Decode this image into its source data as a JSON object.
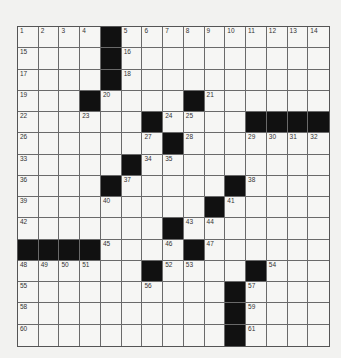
{
  "puzzle": {
    "rows": 15,
    "cols": 15,
    "grid": [
      [
        "1",
        "2",
        "3",
        "4",
        "#",
        "5",
        "6",
        "7",
        "8",
        "9",
        "10",
        "11",
        "12",
        "13",
        "14"
      ],
      [
        "15",
        "",
        "",
        "",
        "#",
        "16",
        "",
        "",
        "",
        "",
        "",
        "",
        "",
        "",
        ""
      ],
      [
        "17",
        "",
        "",
        "",
        "#",
        "18",
        "",
        "",
        "",
        "",
        "",
        "",
        "",
        "",
        ""
      ],
      [
        "19",
        "",
        "",
        "#",
        "20",
        "",
        "",
        "",
        "#",
        "21",
        "",
        "",
        "",
        "",
        ""
      ],
      [
        "22",
        "",
        "",
        "23",
        "",
        "",
        "#",
        "24",
        "25",
        "",
        "",
        "#",
        "#",
        "#",
        "#"
      ],
      [
        "26",
        "",
        "",
        "",
        "",
        "",
        "27",
        "#",
        "28",
        "",
        "",
        "29",
        "30",
        "31",
        "32"
      ],
      [
        "33",
        "",
        "",
        "",
        "",
        "#",
        "34",
        "35",
        "",
        "",
        "",
        "",
        "",
        "",
        ""
      ],
      [
        "36",
        "",
        "",
        "",
        "#",
        "37",
        "",
        "",
        "",
        "",
        "#",
        "38",
        "",
        "",
        ""
      ],
      [
        "39",
        "",
        "",
        "",
        "40",
        "",
        "",
        "",
        "",
        "#",
        "41",
        "",
        "",
        "",
        ""
      ],
      [
        "42",
        "",
        "",
        "",
        "",
        "",
        "",
        "#",
        "43",
        "44",
        "",
        "",
        "",
        "",
        ""
      ],
      [
        "#",
        "#",
        "#",
        "#",
        "45",
        "",
        "",
        "46",
        "#",
        "47",
        "",
        "",
        "",
        "",
        ""
      ],
      [
        "48",
        "49",
        "50",
        "51",
        "",
        "",
        "#",
        "52",
        "53",
        "",
        "",
        "#",
        "54",
        "",
        ""
      ],
      [
        "55",
        "",
        "",
        "",
        "",
        "",
        "56",
        "",
        "",
        "",
        "#",
        "57",
        "",
        "",
        ""
      ],
      [
        "58",
        "",
        "",
        "",
        "",
        "",
        "",
        "",
        "",
        "",
        "#",
        "59",
        "",
        "",
        ""
      ],
      [
        "60",
        "",
        "",
        "",
        "",
        "",
        "",
        "",
        "",
        "",
        "#",
        "61",
        "",
        "",
        ""
      ]
    ],
    "colors": {
      "block": "#111111",
      "cell": "#f6f6f4",
      "line": "#6a6a6a"
    }
  }
}
